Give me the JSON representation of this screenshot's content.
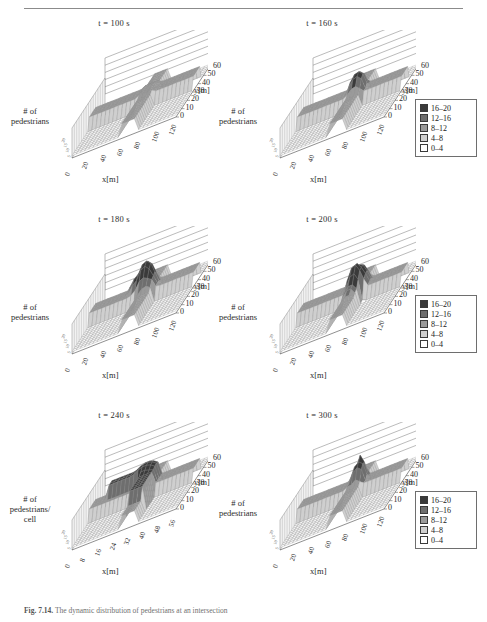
{
  "figure": {
    "caption_label": "Fig. 7.14.",
    "caption_text": "The dynamic distribution of pedestrians at an intersection"
  },
  "legend": {
    "title": "",
    "entries": [
      {
        "label": "16–20",
        "color": "#3a3a3a"
      },
      {
        "label": "12–16",
        "color": "#6e6e6e"
      },
      {
        "label": "8–12",
        "color": "#9a9a9a"
      },
      {
        "label": "4–8",
        "color": "#cfcfcf"
      },
      {
        "label": "0–4",
        "color": "#ffffff"
      }
    ]
  },
  "axes": {
    "xlabel": "x[m]",
    "ylabel": "y[m]",
    "zlabel_2line": "# of\npedestrians",
    "zlabel_3line": "# of\npedestrians/\ncell",
    "zlabel_line1": "# of",
    "zlabel_line2": "pedestrians",
    "zlabel_line2_alt": "pedestrians/",
    "zlabel_line3": "cell",
    "xticks": [
      "0",
      "20",
      "40",
      "60",
      "80",
      "100",
      "120"
    ],
    "xticks_alt": [
      "0",
      "8",
      "16",
      "24",
      "32",
      "40",
      "48",
      "56"
    ],
    "yticks": [
      "60",
      "50",
      "40",
      "30",
      "20",
      "10",
      "0"
    ],
    "zticks": [
      "20",
      "15",
      "10",
      "5"
    ]
  },
  "panels": [
    {
      "id": "p100",
      "title": "t = 100 s",
      "row": 1,
      "col": "left",
      "zlabel_lines": [
        "# of",
        "pedestrians"
      ],
      "xticks_variant": "default",
      "chart_data": {
        "type": "heatmap",
        "title": "t = 100 s",
        "xlabel": "x[m]",
        "ylabel": "y[m]",
        "zlabel": "# of pedestrians",
        "xlim": [
          0,
          120
        ],
        "ylim": [
          0,
          60
        ],
        "zlim": [
          0,
          20
        ],
        "description": "Two uniform pedestrian streams crossing: a horizontal band along y=40-50 and a vertical band along x=60-80, both at density 8-12; rest of field 0-4.",
        "bands": [
          {
            "orientation": "horizontal",
            "y_range": [
              40,
              50
            ],
            "value": 10,
            "bin": "8-12"
          },
          {
            "orientation": "vertical",
            "x_range": [
              60,
              80
            ],
            "value": 10,
            "bin": "8-12"
          }
        ],
        "peak_value": 11
      }
    },
    {
      "id": "p160",
      "title": "t = 160 s",
      "row": 1,
      "col": "right",
      "zlabel_lines": [
        "# of",
        "pedestrians"
      ],
      "xticks_variant": "default",
      "chart_data": {
        "type": "heatmap",
        "title": "t = 160 s",
        "xlabel": "x[m]",
        "ylabel": "y[m]",
        "zlabel": "# of pedestrians",
        "xlim": [
          0,
          120
        ],
        "ylim": [
          0,
          60
        ],
        "zlim": [
          0,
          20
        ],
        "description": "Crossing streams with a growing congestion peak at the intersection centre (x≈70, y≈45) reaching 16-20.",
        "bands": [
          {
            "orientation": "horizontal",
            "y_range": [
              40,
              50
            ],
            "value": 10,
            "bin": "8-12"
          },
          {
            "orientation": "vertical",
            "x_range": [
              60,
              80
            ],
            "value": 11,
            "bin": "8-12"
          }
        ],
        "peak_value": 18,
        "peak_at": [
          70,
          45
        ]
      }
    },
    {
      "id": "p180",
      "title": "t = 180 s",
      "row": 2,
      "col": "left",
      "zlabel_lines": [
        "# of",
        "pedestrians"
      ],
      "xticks_variant": "default",
      "chart_data": {
        "type": "heatmap",
        "title": "t = 180 s",
        "xlabel": "x[m]",
        "ylabel": "y[m]",
        "zlabel": "# of pedestrians",
        "xlim": [
          0,
          120
        ],
        "ylim": [
          0,
          60
        ],
        "zlim": [
          0,
          20
        ],
        "description": "Congestion spreading upstream of the intersection; dark 16-20 cluster left of centre at x≈50-65, y≈45-55.",
        "bands": [
          {
            "orientation": "horizontal",
            "y_range": [
              40,
              50
            ],
            "value": 10,
            "bin": "8-12"
          },
          {
            "orientation": "vertical",
            "x_range": [
              60,
              80
            ],
            "value": 11,
            "bin": "8-12"
          }
        ],
        "peak_value": 19,
        "peak_at": [
          58,
          48
        ]
      }
    },
    {
      "id": "p200",
      "title": "t = 200 s",
      "row": 2,
      "col": "right",
      "zlabel_lines": [
        "# of",
        "pedestrians"
      ],
      "xticks_variant": "default",
      "chart_data": {
        "type": "heatmap",
        "title": "t = 200 s",
        "xlabel": "x[m]",
        "ylabel": "y[m]",
        "zlabel": "# of pedestrians",
        "xlim": [
          0,
          120
        ],
        "ylim": [
          0,
          60
        ],
        "zlim": [
          0,
          20
        ],
        "description": "Jam core enlarged and shifted downstream along the vertical stream; 16-20 block around x≈65-80, y≈35-50.",
        "bands": [
          {
            "orientation": "horizontal",
            "y_range": [
              40,
              50
            ],
            "value": 10,
            "bin": "8-12"
          },
          {
            "orientation": "vertical",
            "x_range": [
              60,
              80
            ],
            "value": 12,
            "bin": "12-16"
          }
        ],
        "peak_value": 20,
        "peak_at": [
          72,
          42
        ]
      }
    },
    {
      "id": "p240",
      "title": "t = 240 s",
      "row": 3,
      "col": "left",
      "zlabel_lines": [
        "# of",
        "pedestrians/",
        "cell"
      ],
      "xticks_variant": "alt",
      "chart_data": {
        "type": "heatmap",
        "title": "t = 240 s",
        "xlabel": "x[m]",
        "ylabel": "y[m]",
        "zlabel": "# of pedestrians/cell",
        "xlim": [
          0,
          56
        ],
        "ylim": [
          0,
          60
        ],
        "zlim": [
          0,
          20
        ],
        "description": "Close-up of the jam: an L-shaped dark 16-20 region formed by a horizontal arm at y≈45-52 (x 8-32) meeting a vertical tail descending along x≈28-36 towards y≈20.",
        "bands": [
          {
            "orientation": "horizontal",
            "y_range": [
              45,
              52
            ],
            "value": 18,
            "bin": "16-20"
          },
          {
            "orientation": "vertical",
            "x_range": [
              28,
              36
            ],
            "value": 17,
            "bin": "16-20"
          }
        ],
        "peak_value": 20,
        "peak_at": [
          30,
          48
        ]
      }
    },
    {
      "id": "p300",
      "title": "t = 300 s",
      "row": 3,
      "col": "right",
      "zlabel_lines": [
        "# of",
        "pedestrians"
      ],
      "xticks_variant": "default",
      "chart_data": {
        "type": "heatmap",
        "title": "t = 300 s",
        "xlabel": "x[m]",
        "ylabel": "y[m]",
        "zlabel": "# of pedestrians",
        "xlim": [
          0,
          120
        ],
        "ylim": [
          0,
          60
        ],
        "zlim": [
          0,
          20
        ],
        "description": "Jam dissolving; compact dark 16-20 core remains only near the intersection centre x≈65-80, y≈40-50 with a narrow spike.",
        "bands": [
          {
            "orientation": "horizontal",
            "y_range": [
              40,
              50
            ],
            "value": 10,
            "bin": "8-12"
          },
          {
            "orientation": "vertical",
            "x_range": [
              60,
              80
            ],
            "value": 11,
            "bin": "8-12"
          }
        ],
        "peak_value": 19,
        "peak_at": [
          72,
          46
        ]
      }
    }
  ]
}
